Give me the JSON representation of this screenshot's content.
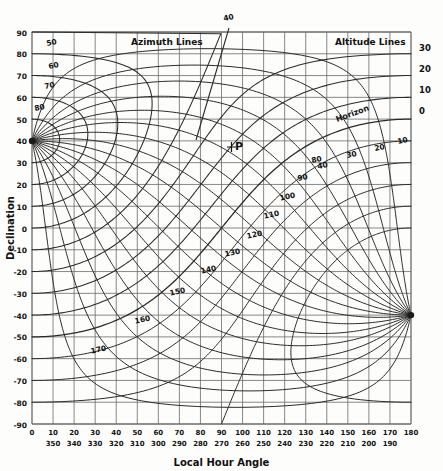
{
  "figure": {
    "title": "",
    "axis_label_x": "Local Hour Angle",
    "axis_label_y": "Declination",
    "annotations": {
      "azimuth_lines": "Azimuth Lines",
      "altitude_lines": "Altitude Lines",
      "horizon": "Horizon",
      "pole_marker": "P",
      "top_azimuth": "40"
    }
  },
  "chart_data": {
    "type": "line",
    "title": "",
    "subtitle": "",
    "xlabel": "Local Hour Angle",
    "ylabel": "Declination",
    "xlim": [
      0,
      180
    ],
    "ylim": [
      -90,
      90
    ],
    "grid": true,
    "legend": "none",
    "x_ticks_primary": [
      0,
      10,
      20,
      30,
      40,
      50,
      60,
      70,
      80,
      90,
      100,
      110,
      120,
      130,
      140,
      150,
      160,
      170,
      180
    ],
    "x_ticks_secondary": [
      "",
      "350",
      "340",
      "330",
      "320",
      "310",
      "300",
      "290",
      "280",
      "270",
      "260",
      "250",
      "240",
      "230",
      "220",
      "210",
      "200",
      "190",
      ""
    ],
    "y_ticks": [
      90,
      80,
      70,
      60,
      50,
      40,
      30,
      20,
      10,
      0,
      -10,
      -20,
      -30,
      -40,
      -50,
      -60,
      -70,
      -80,
      -90
    ],
    "right_axis_label": "Altitude",
    "right_ticks": [
      30,
      20,
      10,
      0
    ],
    "observer_latitude": 40,
    "pole_point": {
      "lha": 0,
      "dec": 40,
      "label": "P"
    },
    "antipole_point": {
      "lha": 180,
      "dec": -40
    },
    "series": [
      {
        "name": "Azimuth 50",
        "label": "50",
        "label_xy": [
          20,
          83
        ]
      },
      {
        "name": "Azimuth 60",
        "label": "60",
        "label_xy": [
          19,
          72
        ]
      },
      {
        "name": "Azimuth 70",
        "label": "70",
        "label_xy": [
          17,
          62
        ]
      },
      {
        "name": "Azimuth 80",
        "label": "80",
        "label_xy": [
          13,
          51
        ]
      },
      {
        "name": "Azimuth 90",
        "label": "90",
        "label_xy": [
          80,
          2
        ]
      },
      {
        "name": "Azimuth 100",
        "label": "100",
        "label_xy": [
          86,
          -6
        ]
      },
      {
        "name": "Azimuth 110",
        "label": "110",
        "label_xy": [
          78,
          -13
        ]
      },
      {
        "name": "Azimuth 120",
        "label": "120",
        "label_xy": [
          70,
          -21
        ]
      },
      {
        "name": "Azimuth 130",
        "label": "130",
        "label_xy": [
          62,
          -28
        ]
      },
      {
        "name": "Azimuth 140",
        "label": "140",
        "label_xy": [
          53,
          -36
        ]
      },
      {
        "name": "Azimuth 150",
        "label": "150",
        "label_xy": [
          44,
          -44
        ]
      },
      {
        "name": "Azimuth 160",
        "label": "160",
        "label_xy": [
          32,
          -52
        ]
      },
      {
        "name": "Azimuth 170",
        "label": "170",
        "label_xy": [
          21,
          -60
        ]
      },
      {
        "name": "Azimuth 40 (top)",
        "label": "40",
        "label_xy": [
          97,
          95
        ]
      },
      {
        "name": "Altitude 0 (horizon)",
        "label": "Horizon",
        "label_xy": [
          142,
          45
        ]
      },
      {
        "name": "Altitude 10",
        "label": "10",
        "label_xy": [
          160,
          29
        ]
      },
      {
        "name": "Altitude 20",
        "label": "20",
        "label_xy": [
          146,
          25
        ]
      },
      {
        "name": "Altitude 30",
        "label": "30",
        "label_xy": [
          132,
          21
        ]
      },
      {
        "name": "Altitude 40",
        "label": "40",
        "label_xy": [
          118,
          16
        ]
      },
      {
        "name": "Altitude 80 label",
        "label": "80",
        "label_xy": [
          117,
          -4
        ]
      }
    ]
  },
  "azimuth_labels": [
    {
      "text": "50",
      "x": 52,
      "y": 45
    },
    {
      "text": "60",
      "x": 54,
      "y": 68
    },
    {
      "text": "70",
      "x": 50,
      "y": 88
    },
    {
      "text": "80",
      "x": 40,
      "y": 110
    },
    {
      "text": "80",
      "x": 317,
      "y": 162
    },
    {
      "text": "90",
      "x": 303,
      "y": 180
    },
    {
      "text": "100",
      "x": 288,
      "y": 199
    },
    {
      "text": "110",
      "x": 272,
      "y": 217
    },
    {
      "text": "120",
      "x": 255,
      "y": 237
    },
    {
      "text": "130",
      "x": 233,
      "y": 255
    },
    {
      "text": "140",
      "x": 209,
      "y": 272
    },
    {
      "text": "150",
      "x": 178,
      "y": 294
    },
    {
      "text": "160",
      "x": 143,
      "y": 322
    },
    {
      "text": "170",
      "x": 99,
      "y": 352
    },
    {
      "text": "40",
      "x": 229,
      "y": 20
    }
  ],
  "altitude_labels": [
    {
      "text": "10",
      "x": 403,
      "y": 143
    },
    {
      "text": "20",
      "x": 380,
      "y": 150
    },
    {
      "text": "30",
      "x": 352,
      "y": 157
    },
    {
      "text": "40",
      "x": 323,
      "y": 168
    }
  ],
  "right_axis_ticks": [
    {
      "text": "30",
      "y": 47
    },
    {
      "text": "20",
      "y": 68
    },
    {
      "text": "10",
      "y": 89
    },
    {
      "text": "0",
      "y": 110
    }
  ]
}
